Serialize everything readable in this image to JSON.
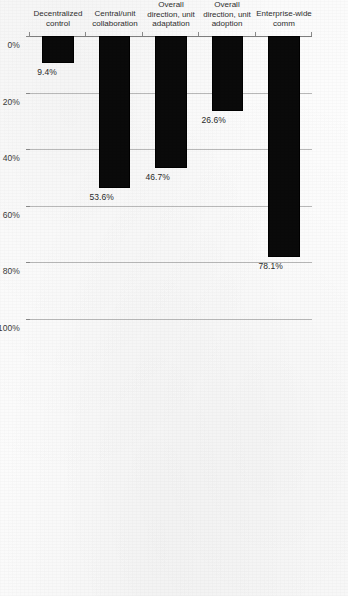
{
  "chart_data": {
    "type": "bar",
    "orientation": "vertical-rotated",
    "title": "",
    "subtitle": "",
    "xlabel": "",
    "ylabel": "",
    "ylim": [
      0,
      100
    ],
    "grid": true,
    "legend": false,
    "legend_position": "none",
    "rotation_degrees": 90,
    "categories": [
      "Enterprise-wide comm",
      "Overall direction, unit\nadoption",
      "Overall direction, unit\nadaptation",
      "Central/unit\ncollaboration",
      "Decentralized control"
    ],
    "values": [
      78.1,
      26.6,
      46.7,
      53.6,
      9.4
    ],
    "data_labels": [
      "78.1%",
      "26.6%",
      "46.7%",
      "53.6%",
      "9.4%"
    ],
    "tick_labels": [
      "0%",
      "20%",
      "40%",
      "60%",
      "80%",
      "100%"
    ],
    "tick_values": [
      0,
      20,
      40,
      60,
      80,
      100
    ],
    "bar_color": "#0a0a0a",
    "gridline_color": "#b8b8b8",
    "axis_color": "#8a8a8a",
    "background_color": "#fdfdfd"
  },
  "axis": {
    "ticks": [
      {
        "label": "0%",
        "value": 0
      },
      {
        "label": "20%",
        "value": 20
      },
      {
        "label": "40%",
        "value": 40
      },
      {
        "label": "60%",
        "value": 60
      },
      {
        "label": "80%",
        "value": 80
      },
      {
        "label": "100%",
        "value": 100
      }
    ]
  },
  "bars": [
    {
      "category": "Enterprise-wide comm",
      "value": 78.1,
      "label": "78.1%"
    },
    {
      "category": "Overall direction, unit\nadoption",
      "value": 26.6,
      "label": "26.6%"
    },
    {
      "category": "Overall direction, unit\nadaptation",
      "value": 46.7,
      "label": "46.7%"
    },
    {
      "category": "Central/unit\ncollaboration",
      "value": 53.6,
      "label": "53.6%"
    },
    {
      "category": "Decentralized control",
      "value": 9.4,
      "label": "9.4%"
    }
  ]
}
